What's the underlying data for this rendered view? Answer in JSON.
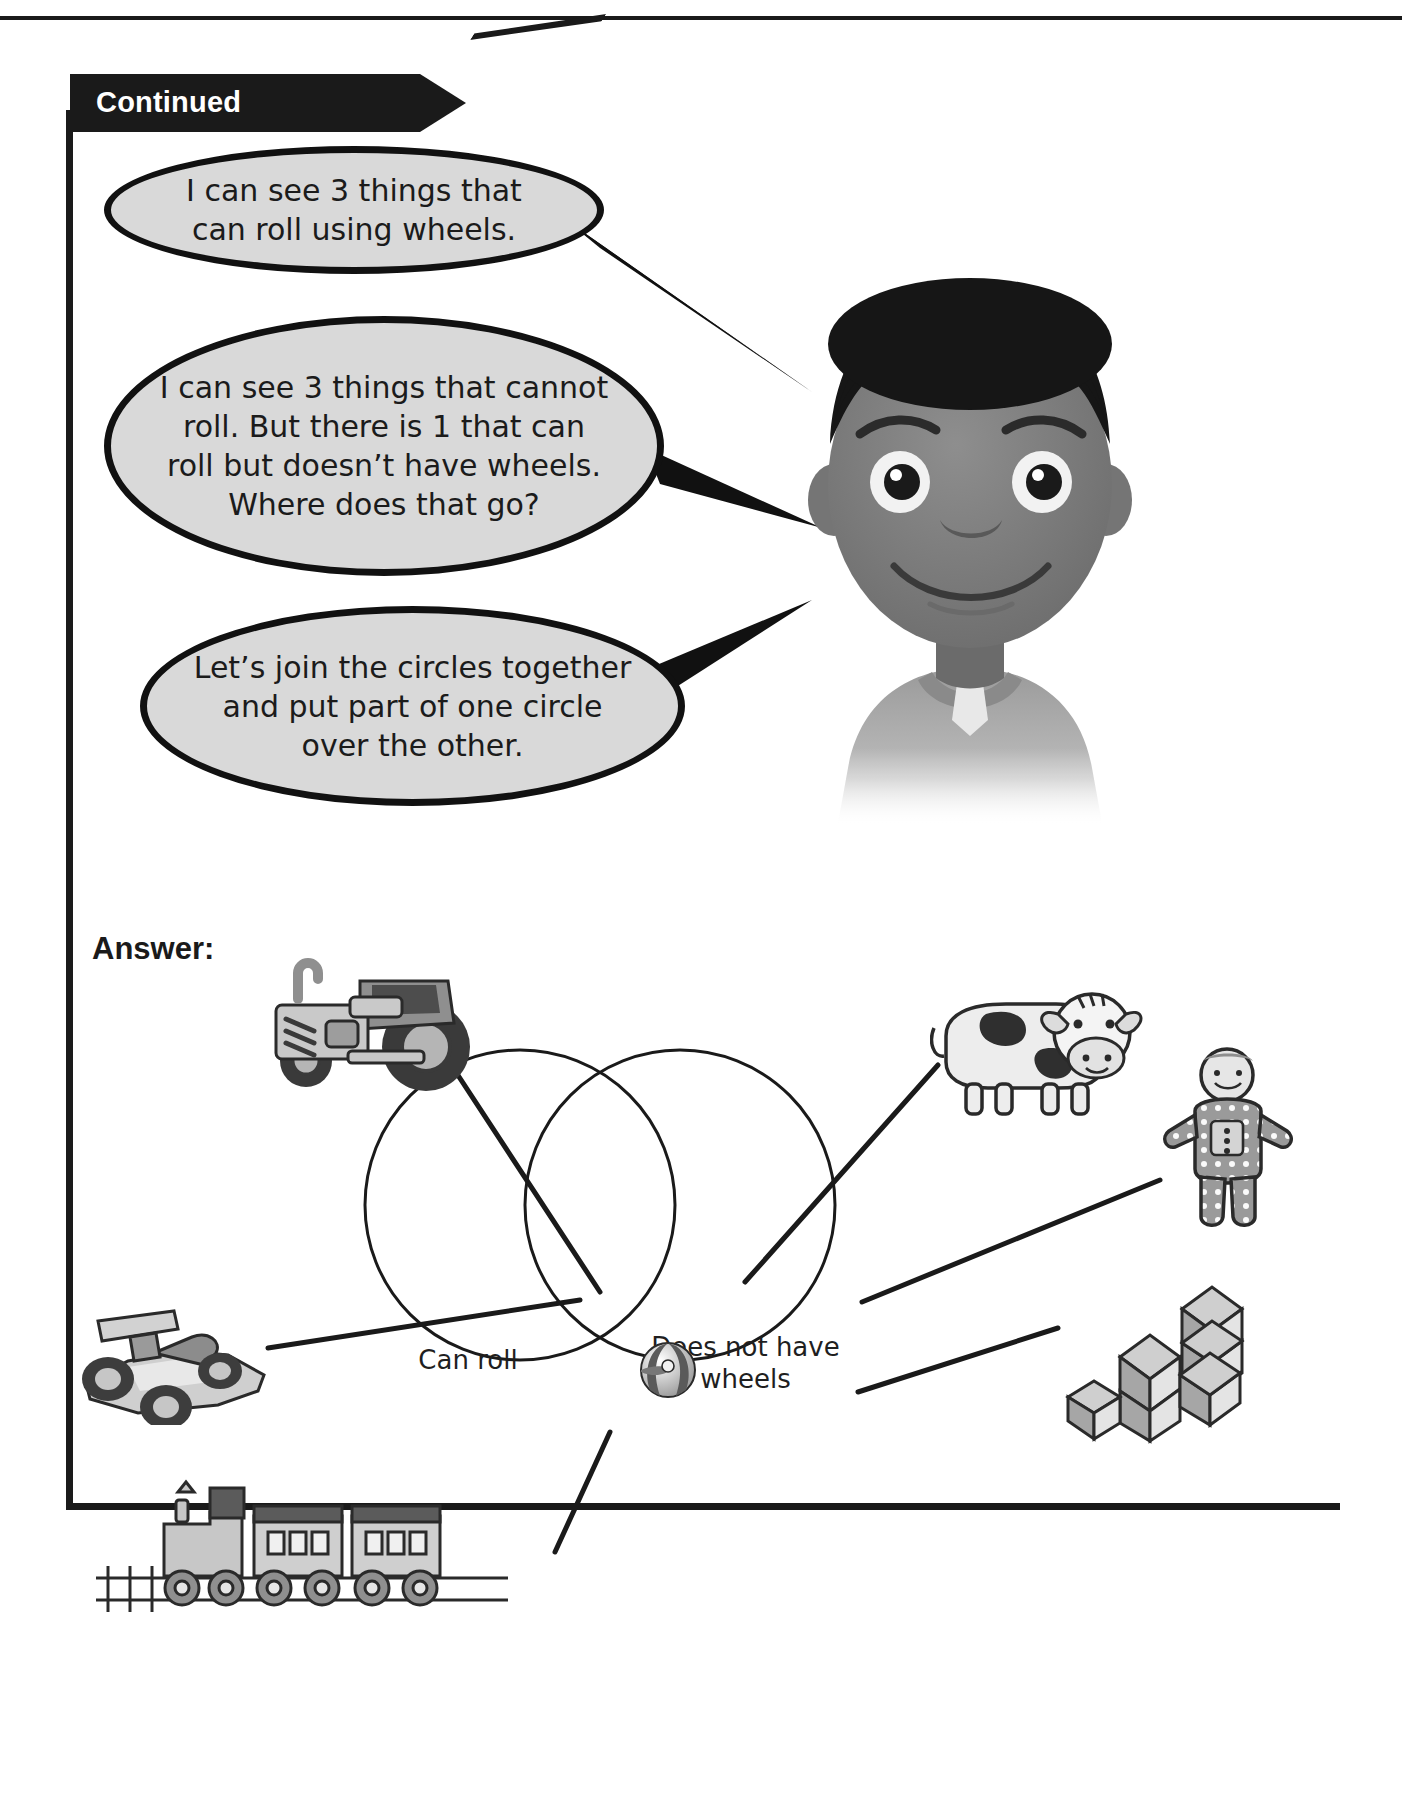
{
  "page": {
    "banner_label": "Continued",
    "answer_label": "Answer:"
  },
  "speech_bubbles": [
    {
      "id": "bubble-1",
      "text": "I can see 3 things that can roll using wheels."
    },
    {
      "id": "bubble-2",
      "text": "I can see 3 things that cannot roll. But there is 1 that can roll but doesn’t have wheels. Where does that go?"
    },
    {
      "id": "bubble-3",
      "text": "Let’s join the circles together and put part of one circle over the other."
    }
  ],
  "character": {
    "name": "boy-illustration",
    "description": "smiling boy"
  },
  "venn": {
    "left_label": "Can roll",
    "right_label": "Does not have wheels",
    "intersection_item": "beach-ball"
  },
  "clipart": [
    {
      "name": "tractor-image",
      "label": "tractor",
      "region": "left-circle"
    },
    {
      "name": "cow-image",
      "label": "cow",
      "region": "right-circle"
    },
    {
      "name": "doll-image",
      "label": "doll",
      "region": "right-circle"
    },
    {
      "name": "racecar-image",
      "label": "race car",
      "region": "left-circle"
    },
    {
      "name": "blocks-image",
      "label": "building blocks",
      "region": "right-circle"
    },
    {
      "name": "train-image",
      "label": "train",
      "region": "left-circle"
    },
    {
      "name": "beachball-image",
      "label": "beach ball",
      "region": "intersection"
    }
  ],
  "colors": {
    "ink": "#1a1a1a",
    "bubble_fill": "#d9d9d9",
    "bubble_stroke": "#111111",
    "page_bg": "#ffffff"
  }
}
